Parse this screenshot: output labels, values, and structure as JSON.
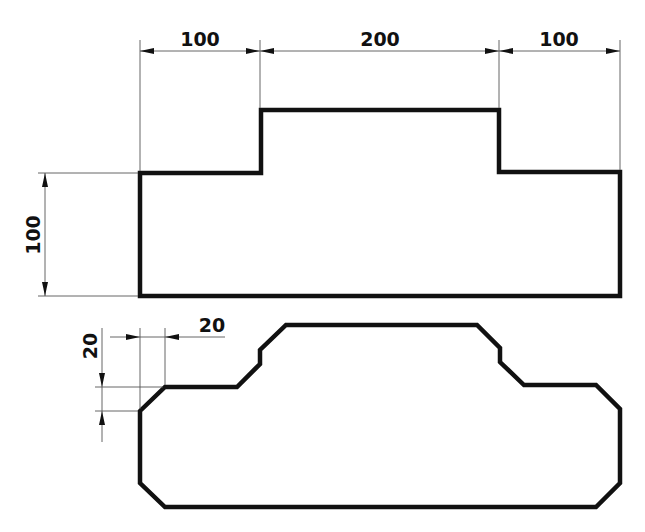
{
  "drawing": {
    "top_view": {
      "dims_horizontal": [
        {
          "label": "100"
        },
        {
          "label": "200"
        },
        {
          "label": "100"
        }
      ],
      "dim_vertical": {
        "label": "100"
      }
    },
    "bottom_view": {
      "chamfer_dim_horizontal": {
        "label": "20"
      },
      "chamfer_dim_vertical": {
        "label": "20"
      }
    },
    "colors": {
      "outline": "#111111",
      "dimension_line": "#555555",
      "background": "#ffffff"
    }
  }
}
